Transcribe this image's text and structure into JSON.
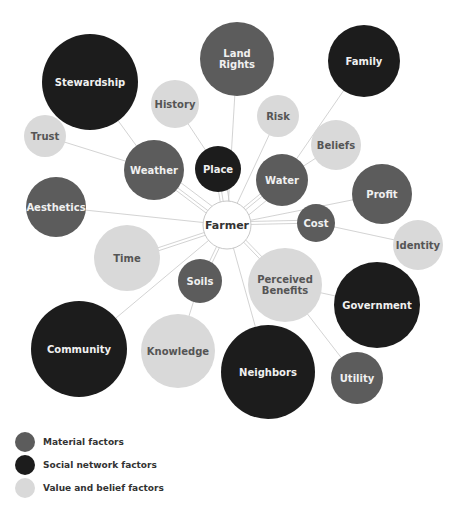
{
  "colors": {
    "material": "#5c5c5c",
    "social": "#1c1c1c",
    "value": "#d9d9d9",
    "center_fill": "#ffffff",
    "center_stroke": "#c8c8c8",
    "line": "#c8c8c8",
    "text_light": "#f0f0f0",
    "text_dark": "#555555",
    "text_center": "#333333"
  },
  "center": {
    "id": "farmer",
    "label": "Farmer",
    "x": 227,
    "y": 225,
    "r": 24
  },
  "nodes": [
    {
      "id": "stewardship",
      "label": [
        "Stewardship"
      ],
      "type": "social",
      "x": 90,
      "y": 82,
      "r": 48,
      "connects_to": "weather"
    },
    {
      "id": "land-rights",
      "label": [
        "Land",
        "Rights"
      ],
      "type": "material",
      "x": 237,
      "y": 59,
      "r": 37,
      "connects_to": "farmer"
    },
    {
      "id": "family",
      "label": [
        "Family"
      ],
      "type": "social",
      "x": 364,
      "y": 61,
      "r": 36,
      "connects_to": "water"
    },
    {
      "id": "history",
      "label": [
        "History"
      ],
      "type": "value",
      "x": 175,
      "y": 104,
      "r": 24,
      "connects_to": "place"
    },
    {
      "id": "risk",
      "label": [
        "Risk"
      ],
      "type": "value",
      "x": 278,
      "y": 116,
      "r": 21,
      "connects_to": "farmer"
    },
    {
      "id": "trust",
      "label": [
        "Trust"
      ],
      "type": "value",
      "x": 45,
      "y": 136,
      "r": 21,
      "connects_to": "weather"
    },
    {
      "id": "beliefs",
      "label": [
        "Beliefs"
      ],
      "type": "value",
      "x": 336,
      "y": 145,
      "r": 25,
      "connects_to": "water"
    },
    {
      "id": "weather",
      "label": [
        "Weather"
      ],
      "type": "material",
      "x": 154,
      "y": 170,
      "r": 30,
      "connects_to": "farmer"
    },
    {
      "id": "place",
      "label": [
        "Place"
      ],
      "type": "social",
      "x": 218,
      "y": 169,
      "r": 23,
      "connects_to": "farmer"
    },
    {
      "id": "water",
      "label": [
        "Water"
      ],
      "type": "material",
      "x": 282,
      "y": 180,
      "r": 26,
      "connects_to": "farmer"
    },
    {
      "id": "profit",
      "label": [
        "Profit"
      ],
      "type": "material",
      "x": 382,
      "y": 194,
      "r": 30,
      "connects_to": "farmer"
    },
    {
      "id": "aesthetics",
      "label": [
        "Aesthetics"
      ],
      "type": "material",
      "x": 56,
      "y": 207,
      "r": 30,
      "connects_to": "farmer"
    },
    {
      "id": "cost",
      "label": [
        "Cost"
      ],
      "type": "material",
      "x": 316,
      "y": 223,
      "r": 19,
      "connects_to": "farmer"
    },
    {
      "id": "identity",
      "label": [
        "Identity"
      ],
      "type": "value",
      "x": 418,
      "y": 245,
      "r": 25,
      "connects_to": "cost"
    },
    {
      "id": "time",
      "label": [
        "Time"
      ],
      "type": "value",
      "x": 127,
      "y": 258,
      "r": 33,
      "connects_to": "farmer"
    },
    {
      "id": "soils",
      "label": [
        "Soils"
      ],
      "type": "material",
      "x": 200,
      "y": 281,
      "r": 22,
      "connects_to": "farmer"
    },
    {
      "id": "perceived-benefits",
      "label": [
        "Perceived",
        "Benefits"
      ],
      "type": "value",
      "x": 285,
      "y": 285,
      "r": 37,
      "connects_to": "farmer"
    },
    {
      "id": "government",
      "label": [
        "Government"
      ],
      "type": "social",
      "x": 377,
      "y": 305,
      "r": 43,
      "connects_to": "perceived-benefits"
    },
    {
      "id": "community",
      "label": [
        "Community"
      ],
      "type": "social",
      "x": 79,
      "y": 349,
      "r": 48,
      "connects_to": "farmer"
    },
    {
      "id": "knowledge",
      "label": [
        "Knowledge"
      ],
      "type": "value",
      "x": 178,
      "y": 351,
      "r": 37,
      "connects_to": "soils"
    },
    {
      "id": "neighbors",
      "label": [
        "Neighbors"
      ],
      "type": "social",
      "x": 268,
      "y": 372,
      "r": 47,
      "connects_to": "farmer"
    },
    {
      "id": "utility",
      "label": [
        "Utility"
      ],
      "type": "material",
      "x": 357,
      "y": 378,
      "r": 26,
      "connects_to": "perceived-benefits"
    }
  ],
  "extra_links": [
    [
      "weather",
      "farmer"
    ],
    [
      "weather",
      "farmer"
    ],
    [
      "place",
      "farmer"
    ],
    [
      "place",
      "farmer"
    ],
    [
      "water",
      "farmer"
    ],
    [
      "water",
      "farmer"
    ],
    [
      "soils",
      "farmer"
    ],
    [
      "perceived-benefits",
      "farmer"
    ],
    [
      "cost",
      "farmer"
    ],
    [
      "time",
      "farmer"
    ]
  ],
  "legend": {
    "items": [
      {
        "type": "material",
        "label": "Material factors"
      },
      {
        "type": "social",
        "label": "Social network factors"
      },
      {
        "type": "value",
        "label": "Value and belief factors"
      }
    ]
  }
}
